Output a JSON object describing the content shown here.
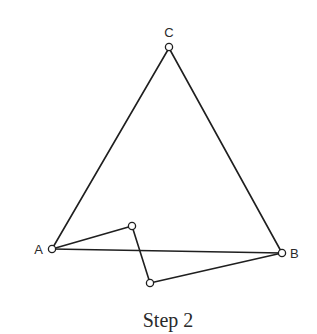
{
  "caption": "Step 2",
  "points": {
    "A": {
      "label": "A",
      "x": 52,
      "y": 249
    },
    "B": {
      "label": "B",
      "x": 282,
      "y": 253
    },
    "C": {
      "label": "C",
      "x": 169,
      "y": 48
    },
    "P1": {
      "label": "",
      "x": 132,
      "y": 226
    },
    "P2": {
      "label": "",
      "x": 150,
      "y": 283
    }
  },
  "edges": [
    [
      "A",
      "C"
    ],
    [
      "C",
      "B"
    ],
    [
      "A",
      "B"
    ],
    [
      "A",
      "P1"
    ],
    [
      "P1",
      "P2"
    ],
    [
      "P2",
      "B"
    ]
  ],
  "colors": {
    "stroke": "#1f1f1f",
    "background": "#ffffff"
  }
}
